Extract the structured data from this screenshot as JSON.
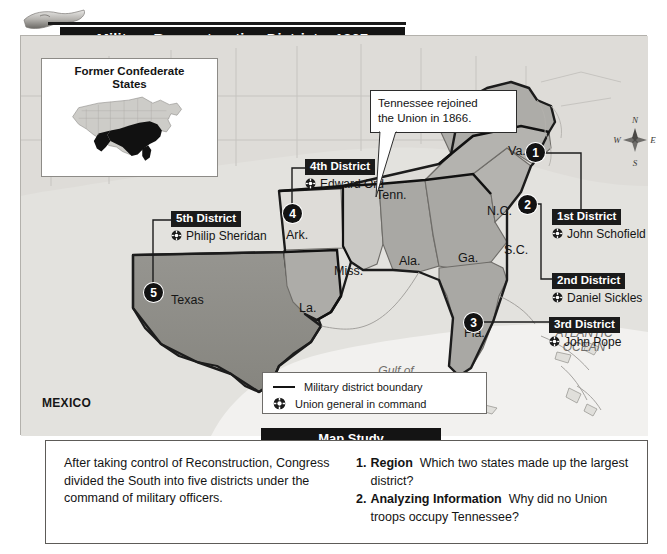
{
  "title": {
    "text": "Military Reconstruction Districts, 1867"
  },
  "inset": {
    "title_line1": "Former Confederate",
    "title_line2": "States"
  },
  "callout": {
    "line1": "Tennessee rejoined",
    "line2": "the Union in 1866."
  },
  "compass": {
    "north": "N",
    "east": "E",
    "south": "S",
    "west": "W"
  },
  "districts": [
    {
      "number": "1",
      "tag": "1st District",
      "general": "John Schofield"
    },
    {
      "number": "2",
      "tag": "2nd District",
      "general": "Daniel Sickles"
    },
    {
      "number": "3",
      "tag": "3rd District",
      "general": "John Pope"
    },
    {
      "number": "4",
      "tag": "4th District",
      "general": "Edward Ord"
    },
    {
      "number": "5",
      "tag": "5th District",
      "general": "Philip Sheridan"
    }
  ],
  "state_labels": [
    {
      "name": "Va."
    },
    {
      "name": "N.C."
    },
    {
      "name": "S.C."
    },
    {
      "name": "Ga."
    },
    {
      "name": "Ala."
    },
    {
      "name": "Miss."
    },
    {
      "name": "La."
    },
    {
      "name": "Ark."
    },
    {
      "name": "Tenn."
    },
    {
      "name": "Texas"
    },
    {
      "name": "Fla."
    }
  ],
  "country_labels": [
    {
      "name": "MEXICO"
    }
  ],
  "water_labels": {
    "gulf_line1": "Gulf of",
    "gulf_line2": "Mexico",
    "ocean_line1": "ATLANTIC",
    "ocean_line2": "OCEAN"
  },
  "legend": {
    "boundary": "Military district boundary",
    "general": "Union general in command"
  },
  "map_study": {
    "banner": "Map Study",
    "summary": "After taking control of Reconstruction, Congress divided the South into five districts under the command of military officers.",
    "questions": [
      {
        "num": "1.",
        "label": "Region",
        "text": "Which two states made up the largest district?"
      },
      {
        "num": "2.",
        "label": "Analyzing Information",
        "text": "Why did no Union troops occupy Tennessee?"
      }
    ]
  },
  "colors": {
    "district_fill": "#a9a8a4",
    "texas_fill": "#8e8d89",
    "land": "#dcdbd7",
    "water": "#f1f0ee",
    "banner": "#141414"
  }
}
